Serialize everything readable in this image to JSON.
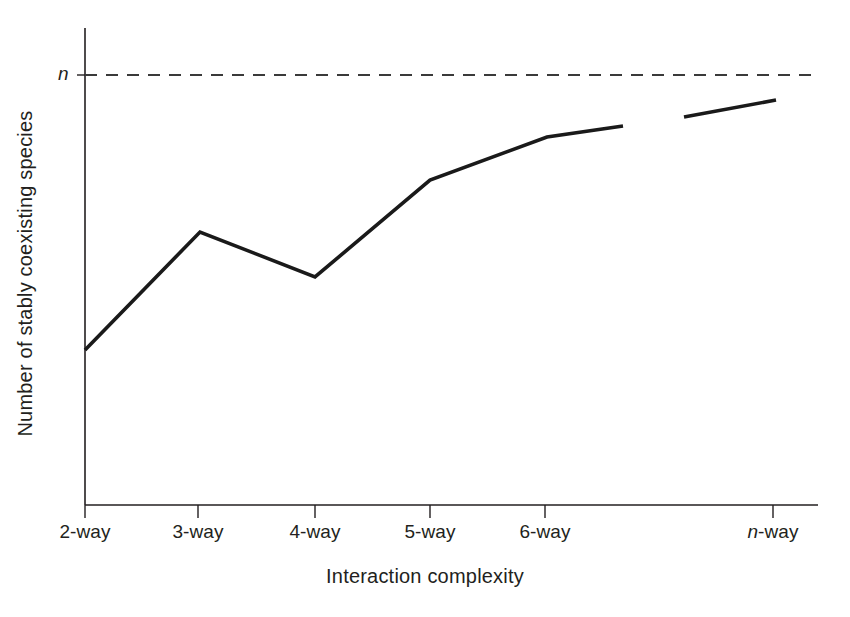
{
  "chart_data": {
    "type": "line",
    "title": "",
    "subtitle": "",
    "xlabel": "Interaction complexity",
    "ylabel": "Number of stably coexisting species",
    "categories": [
      "2-way",
      "3-way",
      "4-way",
      "5-way",
      "6-way",
      "n-way"
    ],
    "tick_labels": [
      {
        "text": "2-way",
        "italic_prefix": "",
        "plain": "2-way"
      },
      {
        "text": "3-way",
        "italic_prefix": "",
        "plain": "3-way"
      },
      {
        "text": "4-way",
        "italic_prefix": "",
        "plain": "4-way"
      },
      {
        "text": "5-way",
        "italic_prefix": "",
        "plain": "5-way"
      },
      {
        "text": "6-way",
        "italic_prefix": "",
        "plain": "6-way"
      },
      {
        "text": "n-way",
        "italic_prefix": "n",
        "plain": "-way"
      }
    ],
    "y_tick_labels": [
      "n"
    ],
    "y_axis_ticks_numeric": false,
    "x_axis_ticks_numeric": false,
    "grid": false,
    "legend": false,
    "legend_position": "none",
    "series": [
      {
        "name": "Number of stably coexisting species",
        "style": "solid",
        "color": "#1a1a1a",
        "broken": true,
        "segments": [
          {
            "name": "main-run",
            "points": [
              {
                "x_label": "2-way",
                "x": 2,
                "y": 0.36
              },
              {
                "x_label": "3-way",
                "x": 3,
                "y": 0.64
              },
              {
                "x_label": "4-way",
                "x": 4,
                "y": 0.54
              },
              {
                "x_label": "5-way",
                "x": 5,
                "y": 0.76
              },
              {
                "x_label": "6-way",
                "x": 6,
                "y": 0.86
              },
              {
                "x_label": "",
                "x": 6.65,
                "y": 0.88
              }
            ]
          },
          {
            "name": "n-way-run",
            "points": [
              {
                "x_label": "",
                "x": 7.18,
                "y": 0.9
              },
              {
                "x_label": "n-way",
                "x": 7.98,
                "y": 0.94
              }
            ]
          }
        ]
      }
    ],
    "reference_lines": [
      {
        "name": "n-asymptote",
        "orientation": "horizontal",
        "label": "n",
        "value": 1.0,
        "style": "dashed",
        "color": "#3a3a3a"
      }
    ],
    "ylim": [
      0,
      1.08
    ],
    "xlim_labels": [
      "2-way",
      "n-way"
    ]
  },
  "geometry": {
    "axis_x": 85,
    "axis_y_top": 28,
    "axis_y_baseline": 505,
    "axis_x_right": 818,
    "threshold_y": 75,
    "tick_x_positions": [
      85,
      198,
      315,
      430,
      545,
      773
    ],
    "tick_label_y": 521,
    "polyline_a": "85,350 200,232 315,277 430,180 547,137 623,126",
    "polyline_b": "684,117 776,100"
  },
  "colors": {
    "background": "#ffffff",
    "ink": "#231f20",
    "line": "#1a1a1a",
    "dashed": "#3a3a3a"
  }
}
